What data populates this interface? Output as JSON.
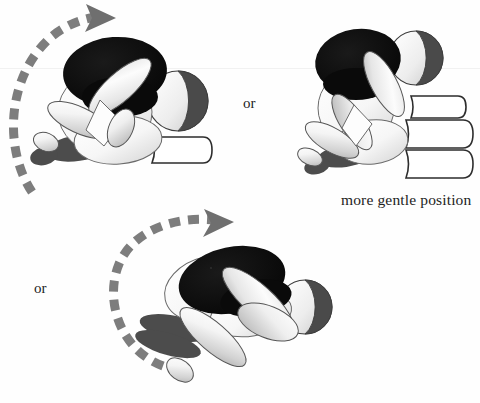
{
  "figure": {
    "title": "",
    "type": "instructional-line-diagram",
    "background_color": "#fefefe",
    "ink_color": "#232323",
    "panels": [
      {
        "id": "panel-left-top",
        "name": "child-sitting-forward-bend-with-bolster",
        "position": {
          "x": 0,
          "y": 0,
          "width": 235,
          "height": 205
        },
        "props": [
          "bolster-roll",
          "exercise-ball"
        ],
        "motion_arrow": {
          "name": "rotation-arrow-counterclockwise",
          "style": "dashed",
          "color": "#7d7d7d",
          "direction": "up-and-over-to-right"
        }
      },
      {
        "id": "panel-right-top",
        "name": "child-sitting-forward-bend-on-block-stack",
        "position": {
          "x": 290,
          "y": 20,
          "width": 190,
          "height": 170
        },
        "props": [
          "block-stack-three",
          "exercise-ball"
        ],
        "motion_arrow": null,
        "caption": "more gentle position"
      },
      {
        "id": "panel-bottom",
        "name": "child-side-lying-twist",
        "position": {
          "x": 100,
          "y": 205,
          "width": 260,
          "height": 198
        },
        "props": [
          "exercise-ball"
        ],
        "motion_arrow": {
          "name": "rotation-arrow-counterclockwise",
          "style": "dashed",
          "color": "#7d7d7d",
          "direction": "up-and-over-to-right"
        }
      }
    ]
  },
  "labels": {
    "or_top": "or",
    "or_bottom": "or",
    "gentle_position": "more gentle position"
  },
  "colors": {
    "outline": "#3c3c3c",
    "hair_black": "#0d0d0d",
    "shadow_gray": "#4c4c4c",
    "limb_light": "#f2f2f2",
    "limb_mid": "#cfcfcf",
    "arrow_gray": "#7d7d7d",
    "ball_dark": "#4a4a4a",
    "background": "#fefefe"
  },
  "icons": {
    "motion_arrow": "dashed-curved-arrow-icon",
    "exercise_ball": "ball-icon",
    "bolster": "bolster-roll-icon",
    "block_stack": "block-stack-icon"
  }
}
